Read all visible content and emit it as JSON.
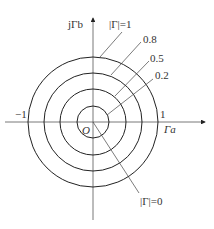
{
  "diagram": {
    "axes": {
      "vertical_label": "jΓb",
      "horizontal_label": "Γa",
      "origin_label": "O",
      "neg_one_label": "−1",
      "pos_one_label": "1"
    },
    "circles": [
      {
        "label": "|Γ|=1",
        "value": 1.0
      },
      {
        "label": "0.8",
        "value": 0.8
      },
      {
        "label": "0.5",
        "value": 0.5
      },
      {
        "label": "0.2",
        "value": 0.2
      }
    ],
    "center_label": "|Γ|=0",
    "colors": {
      "stroke": "#222222",
      "text": "#333333",
      "background": "#ffffff"
    }
  }
}
